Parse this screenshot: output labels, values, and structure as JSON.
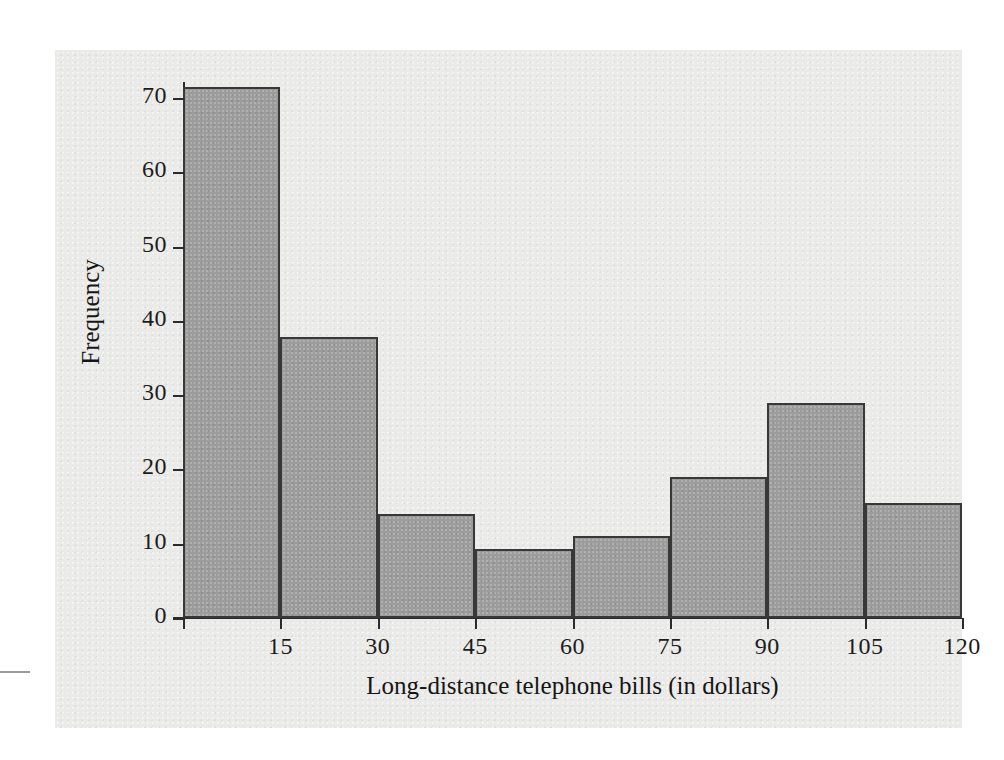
{
  "chart_data": {
    "type": "bar",
    "title": "",
    "subtitle": "",
    "xlabel": "Long-distance telephone bills (in dollars)",
    "ylabel": "Frequency",
    "categories": [
      "0-15",
      "15-30",
      "30-45",
      "45-60",
      "60-75",
      "75-90",
      "90-105",
      "105-120"
    ],
    "bin_edges": [
      0,
      15,
      30,
      45,
      60,
      75,
      90,
      105,
      120
    ],
    "values": [
      71.5,
      37.8,
      14,
      9.3,
      11,
      19,
      29,
      15.5
    ],
    "bars": [
      {
        "label": "0-15",
        "lower": 0,
        "upper": 15,
        "value": 71.5
      },
      {
        "label": "15-30",
        "lower": 15,
        "upper": 30,
        "value": 37.8
      },
      {
        "label": "30-45",
        "lower": 30,
        "upper": 45,
        "value": 14
      },
      {
        "label": "45-60",
        "lower": 45,
        "upper": 60,
        "value": 9.3
      },
      {
        "label": "60-75",
        "lower": 60,
        "upper": 75,
        "value": 11
      },
      {
        "label": "75-90",
        "lower": 75,
        "upper": 90,
        "value": 19
      },
      {
        "label": "90-105",
        "lower": 90,
        "upper": 105,
        "value": 29
      },
      {
        "label": "105-120",
        "lower": 105,
        "upper": 120,
        "value": 15.5
      }
    ],
    "xticks": [
      15,
      30,
      45,
      60,
      75,
      90,
      105,
      120
    ],
    "xtick_labels": [
      "15",
      "30",
      "45",
      "60",
      "75",
      "90",
      "105",
      "120"
    ],
    "yticks": [
      0,
      10,
      20,
      30,
      40,
      50,
      60,
      70
    ],
    "ytick_labels": [
      "0",
      "10",
      "20",
      "30",
      "40",
      "50",
      "60",
      "70"
    ],
    "xlim": [
      0,
      120
    ],
    "ylim": [
      0,
      74
    ],
    "grid": false,
    "legend": null,
    "annotations": [],
    "colors": {
      "bar_fill": "#9c9c9c",
      "bar_edge": "#383838",
      "panel_background": "#eaeae8",
      "page_background": "#ffffff",
      "axis": "#2b2b2b",
      "text": "#1c1c1c"
    }
  }
}
